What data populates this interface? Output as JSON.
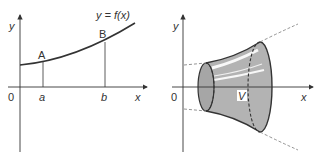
{
  "left_graph": {
    "y_axis_label": "y",
    "x_axis_label": "x",
    "origin_label": "0",
    "curve_label": "y = f(x)",
    "point_a_label": "A",
    "point_b_label": "B",
    "tick_a_label": "a",
    "tick_b_label": "b"
  },
  "right_graph": {
    "y_axis_label": "y",
    "x_axis_label": "x",
    "origin_label": "0",
    "volume_label": "V"
  },
  "colors": {
    "line": "#333333",
    "solid_fill": "#b3b3b3",
    "dashed": "#777777",
    "highlight": "#ffffff"
  }
}
